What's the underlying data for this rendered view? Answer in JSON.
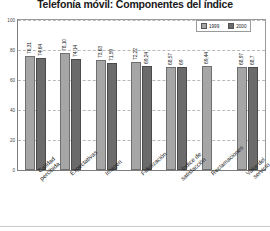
{
  "chart_data": {
    "type": "bar",
    "title": "Telefonía móvil: Componentes del índice",
    "xlabel": "",
    "ylabel": "",
    "ylim": [
      0,
      100
    ],
    "yticks": [
      0,
      20,
      40,
      60,
      80,
      100
    ],
    "ytick_labels": [
      "0",
      "20",
      "40",
      "60",
      "80",
      "100"
    ],
    "grid": true,
    "legend_position": "top-right",
    "categories": [
      "Calidad percibida",
      "Expectativas",
      "Imagen",
      "Fidelización",
      "Índice de satisfacción",
      "Reclamaciones",
      "Valor del servicio"
    ],
    "category_lines": [
      [
        "Calidad",
        "percibida"
      ],
      [
        "Expectativas"
      ],
      [
        "Imagen"
      ],
      [
        "Fidelización"
      ],
      [
        "Índice de",
        "satisfacción"
      ],
      [
        "Reclamaciones"
      ],
      [
        "Valor del",
        "servicio"
      ]
    ],
    "series": [
      {
        "name": "1999",
        "color": "#a6a6a6",
        "values": [
          76.31,
          78.1,
          73.63,
          72.22,
          68.57,
          69.44,
          68.97
        ],
        "labels": [
          "76,31",
          "78,10",
          "73,63",
          "72,22",
          "68,57",
          "69,44",
          "68,97"
        ]
      },
      {
        "name": "2000",
        "color": "#6b6b6b",
        "values": [
          74.64,
          74.14,
          71.59,
          69.24,
          69.0,
          null,
          68.7
        ],
        "labels": [
          "74,64",
          "74,14",
          "71,59",
          "69,24",
          "69",
          "",
          "68,7"
        ]
      }
    ]
  },
  "colors": {
    "series1": "#a6a6a6",
    "series2": "#6b6b6b",
    "grid": "#b9b9b9",
    "axis": "#7d7d7d",
    "frame": "#9a9a9a"
  }
}
